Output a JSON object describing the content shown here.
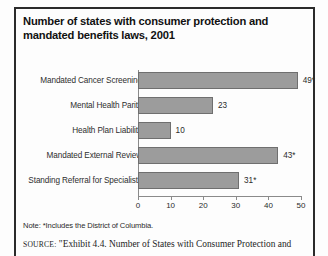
{
  "figure": {
    "title": "Number of states with consumer protection and mandated benefits laws, 2001",
    "note": "Note: *Includes the District of Columbia.",
    "source_prefix": "SOURCE:",
    "source_text": "\"Exhibit 4.4. Number of States with Consumer Protection and"
  },
  "colors": {
    "bar_fill": "#9c9c9c",
    "bar_stroke": "#6f6f6f",
    "axis": "#8a8a8a",
    "frame": "#2b2b2b",
    "text": "#2b2b2b"
  },
  "chart_data": {
    "type": "bar",
    "orientation": "horizontal",
    "title": "Number of states with consumer protection and mandated benefits laws, 2001",
    "xlabel": "",
    "ylabel": "",
    "xlim": [
      0,
      50
    ],
    "grid": false,
    "legend": "none",
    "categories": [
      "Mandated Cancer Screening",
      "Mental Health Parity",
      "Health Plan Liability",
      "Mandated External Review",
      "Standing Referral for Specialists"
    ],
    "values": [
      49,
      23,
      10,
      43,
      31
    ],
    "value_labels": [
      "49*",
      "23",
      "10",
      "43*",
      "31*"
    ],
    "xticks": [
      0,
      10,
      20,
      30,
      40,
      50
    ],
    "xtick_labels": [
      "0",
      "10",
      "20",
      "30",
      "40",
      "50"
    ],
    "annotations": [
      "*Includes the District of Columbia."
    ]
  }
}
